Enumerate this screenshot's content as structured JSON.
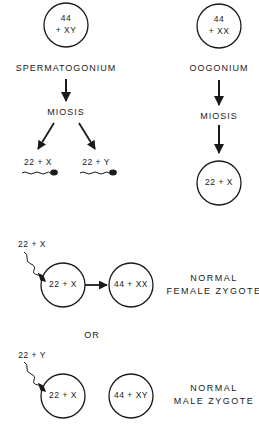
{
  "diagram": {
    "male_lineage": {
      "parent_cell": {
        "line1": "44",
        "line2": "+ XY"
      },
      "parent_label": "SPERMATOGONIUM",
      "process": "MIOSIS",
      "gametes": [
        {
          "label": "22 + X"
        },
        {
          "label": "22 + Y"
        }
      ]
    },
    "female_lineage": {
      "parent_cell": {
        "line1": "44",
        "line2": "+  XX"
      },
      "parent_label": "OOGONIUM",
      "process": "MIOSIS",
      "gamete": {
        "label": "22 + X"
      }
    },
    "outcomes": [
      {
        "sperm_label": "22 + X",
        "egg_label": "22 + X",
        "zygote_label": "44 + XX",
        "result_line1": "NORMAL",
        "result_line2": "FEMALE ZYGOTE"
      },
      {
        "sperm_label": "22 + Y",
        "egg_label": "22 + X",
        "zygote_label": "44 + XY",
        "result_line1": "NORMAL",
        "result_line2": "MALE ZYGOTE"
      }
    ],
    "separator": "OR"
  }
}
